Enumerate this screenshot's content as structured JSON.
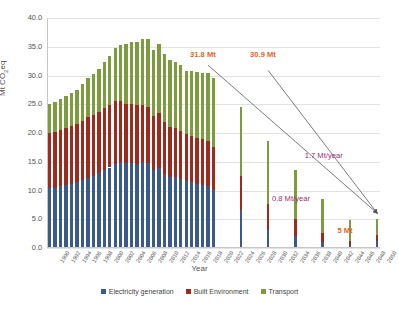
{
  "chart_data": {
    "type": "bar",
    "stacked": true,
    "title": "",
    "xlabel": "Year",
    "ylabel": "Mt CO2eq",
    "ylabel_display": "Mt CO₂eq",
    "ylim": [
      0,
      40
    ],
    "ytick_step": 5,
    "yticks": [
      "0.0",
      "5.0",
      "10.0",
      "15.0",
      "20.0",
      "25.0",
      "30.0",
      "35.0",
      "40.0"
    ],
    "xlim": [
      1990,
      2050
    ],
    "grid": true,
    "legend_position": "bottom",
    "series": [
      {
        "name": "Electricity generation",
        "color": "#3b5a8c",
        "values": [
          10.4,
          10.5,
          10.7,
          10.9,
          11.2,
          11.4,
          11.8,
          12.2,
          12.6,
          13.0,
          13.6,
          14.0,
          14.6,
          15.0,
          14.7,
          14.8,
          14.6,
          14.9,
          14.7,
          13.6,
          13.9,
          12.9,
          12.4,
          12.3,
          12.0,
          11.6,
          11.4,
          11.2,
          11.0,
          10.8,
          10.1,
          9.4,
          8.7,
          8.0,
          7.3,
          6.6,
          5.9,
          5.2,
          4.5,
          3.8,
          3.1,
          2.9,
          2.7,
          2.5,
          2.3,
          2.1,
          1.9,
          1.7,
          1.5,
          1.3,
          1.1,
          1.0,
          0.9,
          0.8,
          0.7,
          0.6,
          0.5,
          0.4,
          0.3,
          0.2,
          1.2
        ]
      },
      {
        "name": "Built Environment",
        "color": "#9e2a1e",
        "values": [
          9.6,
          9.6,
          9.8,
          9.9,
          10.0,
          10.1,
          10.3,
          10.5,
          10.5,
          10.6,
          10.7,
          10.8,
          10.9,
          10.5,
          10.4,
          10.3,
          10.3,
          10.0,
          9.8,
          9.3,
          9.6,
          9.0,
          8.7,
          8.6,
          8.4,
          8.2,
          8.1,
          8.0,
          7.9,
          7.8,
          7.5,
          7.2,
          6.9,
          6.6,
          6.3,
          6.0,
          5.7,
          5.4,
          5.1,
          4.8,
          4.5,
          4.2,
          3.9,
          3.6,
          3.3,
          3.0,
          2.7,
          2.4,
          2.1,
          1.8,
          1.5,
          1.3,
          1.1,
          0.9,
          0.8,
          0.7,
          0.6,
          0.5,
          0.4,
          0.3,
          1.1
        ]
      },
      {
        "name": "Transport",
        "color": "#7d9b3f",
        "values": [
          5.0,
          5.3,
          5.4,
          5.6,
          5.8,
          6.0,
          6.4,
          6.8,
          7.2,
          7.6,
          8.0,
          8.6,
          9.3,
          9.8,
          10.4,
          10.8,
          11.0,
          11.5,
          11.9,
          11.6,
          11.9,
          11.8,
          11.6,
          11.5,
          11.4,
          11.0,
          11.2,
          11.4,
          11.6,
          11.8,
          12.0,
          12.0,
          12.0,
          12.0,
          12.0,
          12.0,
          11.8,
          11.6,
          11.4,
          11.2,
          11.0,
          10.5,
          10.0,
          9.5,
          9.0,
          8.5,
          8.0,
          7.5,
          7.0,
          6.5,
          6.0,
          5.5,
          5.0,
          4.5,
          4.0,
          3.5,
          3.0,
          2.5,
          2.0,
          1.5,
          2.7
        ]
      }
    ],
    "categories": [
      "1990",
      "1991",
      "1992",
      "1993",
      "1994",
      "1995",
      "1996",
      "1997",
      "1998",
      "1999",
      "2000",
      "2001",
      "2002",
      "2003",
      "2004",
      "2005",
      "2006",
      "2007",
      "2008",
      "2009",
      "2010",
      "2011",
      "2012",
      "2013",
      "2014",
      "2015",
      "2016",
      "2017",
      "2018",
      "2019",
      "2020",
      "2021",
      "2022",
      "2023",
      "2024",
      "2025",
      "2026",
      "2027",
      "2028",
      "2029",
      "2030",
      "2031",
      "2032",
      "2033",
      "2034",
      "2035",
      "2036",
      "2037",
      "2038",
      "2039",
      "2040",
      "2041",
      "2042",
      "2043",
      "2044",
      "2045",
      "2046",
      "2047",
      "2048",
      "2049",
      "2050"
    ],
    "xtick_labels": [
      "1990",
      "1992",
      "1994",
      "1996",
      "1998",
      "2000",
      "2002",
      "2004",
      "2006",
      "2008",
      "2010",
      "2012",
      "2014",
      "2016",
      "2018",
      "2020",
      "2022",
      "2024",
      "2026",
      "2028",
      "2030",
      "2032",
      "2034",
      "2036",
      "2038",
      "2040",
      "2042",
      "2044",
      "2046",
      "2048",
      "2050"
    ],
    "visible_bar_years": [
      1990,
      1991,
      1992,
      1993,
      1994,
      1995,
      1996,
      1997,
      1998,
      1999,
      2000,
      2001,
      2002,
      2003,
      2004,
      2005,
      2006,
      2007,
      2008,
      2009,
      2010,
      2011,
      2012,
      2013,
      2014,
      2015,
      2016,
      2017,
      2018,
      2019,
      2020,
      2025,
      2030,
      2035,
      2040,
      2045,
      2050
    ],
    "annotations": [
      {
        "text": "31.8 Mt",
        "color": "#e8641c",
        "at_year": 2019,
        "at_value": 33.5
      },
      {
        "text": "30.9 Mt",
        "color": "#e8641c",
        "at_year": 2030,
        "at_value": 33.5
      },
      {
        "text": "1.7 Mt/year",
        "color": "#9b2d6f",
        "at_year": 2040,
        "at_value": 16.0
      },
      {
        "text": "0.8 Mt/year",
        "color": "#9b2d6f",
        "at_year": 2034,
        "at_value": 8.5
      },
      {
        "text": "5 Mt",
        "color": "#e8641c",
        "at_year": 2046,
        "at_value": 3.0
      }
    ],
    "trend_arrows": [
      {
        "from_year": 2019,
        "from_value": 31.8,
        "to_year": 2050,
        "to_value": 5.0,
        "label": "0.8 Mt/year"
      },
      {
        "from_year": 2030,
        "from_value": 30.9,
        "to_year": 2050,
        "to_value": 5.0,
        "label": "1.7 Mt/year"
      }
    ],
    "legend": [
      {
        "label": "Electricity generation",
        "color": "#3b5a8c"
      },
      {
        "label": "Built Environment",
        "color": "#9e2a1e"
      },
      {
        "label": "Transport",
        "color": "#7d9b3f"
      }
    ]
  }
}
